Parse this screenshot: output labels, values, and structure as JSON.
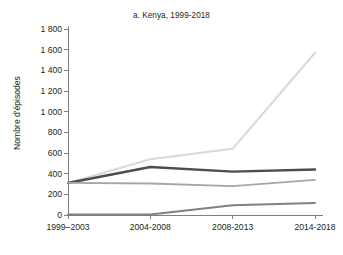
{
  "chart_data": {
    "type": "line",
    "title": "a. Kenya, 1999-2018",
    "xlabel": "",
    "ylabel": "Nombre d'épisodes",
    "categories": [
      "1999–2003",
      "2004-2008",
      "2008-2013",
      "2014-2018"
    ],
    "ylim": [
      0,
      1800
    ],
    "yticks": [
      0,
      200,
      400,
      600,
      800,
      1000,
      1200,
      1400,
      1600,
      1800
    ],
    "ytick_labels": [
      "0",
      "200",
      "400",
      "600",
      "800",
      "1 000",
      "1 200",
      "1 400",
      "1 600",
      "1 800"
    ],
    "grid": false,
    "legend": "none",
    "series": [
      {
        "name": "serie-1",
        "color": "#d9d9d9",
        "width": 2.0,
        "values": [
          310,
          540,
          640,
          1570
        ]
      },
      {
        "name": "serie-2",
        "color": "#4d4d4d",
        "width": 2.4,
        "values": [
          310,
          465,
          420,
          440
        ]
      },
      {
        "name": "serie-3",
        "color": "#a6a6a6",
        "width": 1.8,
        "values": [
          310,
          305,
          280,
          340
        ]
      },
      {
        "name": "serie-4",
        "color": "#808080",
        "width": 2.0,
        "values": [
          5,
          5,
          95,
          115
        ]
      }
    ],
    "axis_color": "#7f7f7f",
    "text_color": "#231f20"
  }
}
